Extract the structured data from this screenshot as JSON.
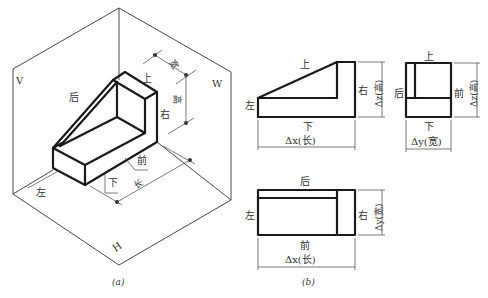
{
  "figure_a": {
    "caption": "(a)",
    "planes": {
      "v": "V",
      "w": "W",
      "h": "H"
    },
    "faces": {
      "top": "上",
      "back": "后",
      "right": "右",
      "front": "前",
      "bottom": "下",
      "left": "左"
    },
    "dimensions": {
      "width": "宽",
      "height": "高",
      "length": "长"
    }
  },
  "figure_b": {
    "caption": "(b)",
    "front_view": {
      "top": "上",
      "bottom": "下",
      "left": "左",
      "right": "右",
      "dim_x": "Δx(长)",
      "dim_z": "Δz(高)"
    },
    "side_view": {
      "top": "上",
      "bottom": "下",
      "back": "后",
      "front": "前",
      "dim_y": "Δy(宽)",
      "dim_z": "Δz(高)"
    },
    "top_view": {
      "top": "后",
      "bottom": "前",
      "left": "左",
      "right": "右",
      "dim_x": "Δx(长)",
      "dim_y": "Δy(宽)"
    }
  },
  "colors": {
    "line": "#1a1a1a",
    "text": "#333333",
    "background": "#ffffff"
  }
}
